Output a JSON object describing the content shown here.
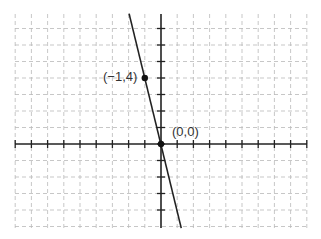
{
  "graph": {
    "x_range": [
      -9,
      9
    ],
    "y_range": [
      -5,
      8
    ],
    "origin_px": [
      161,
      144
    ],
    "unit_px": [
      16.2,
      16.5
    ],
    "grid": "dashed",
    "line": {
      "equation": "y = -4x",
      "from": [
        -1.97,
        7.9
      ],
      "to": [
        1.25,
        -5.1
      ]
    },
    "points": [
      {
        "x": -1,
        "y": 4,
        "label": "(−1,4)"
      },
      {
        "x": 0,
        "y": 0,
        "label": "(0,0)"
      }
    ]
  },
  "labels": {
    "point1": "(−1,4)",
    "point2": "(0,0)"
  }
}
